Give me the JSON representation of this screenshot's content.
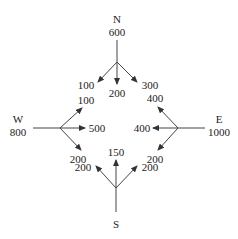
{
  "diagram": {
    "type": "traffic-flow-intersection",
    "nodes": {
      "N": {
        "label": "N",
        "inflow": "600"
      },
      "W": {
        "label": "W",
        "inflow": "800"
      },
      "E": {
        "label": "E",
        "inflow": "1000"
      },
      "S": {
        "label": "S"
      }
    },
    "flows": {
      "n_left": "100",
      "n_straight": "200",
      "n_right": "300",
      "w_up": "100",
      "w_straight": "500",
      "w_down": "200",
      "e_up": "400",
      "e_straight": "400",
      "e_down": "200",
      "s_left": "200",
      "s_straight": "150",
      "s_right": "200"
    }
  }
}
